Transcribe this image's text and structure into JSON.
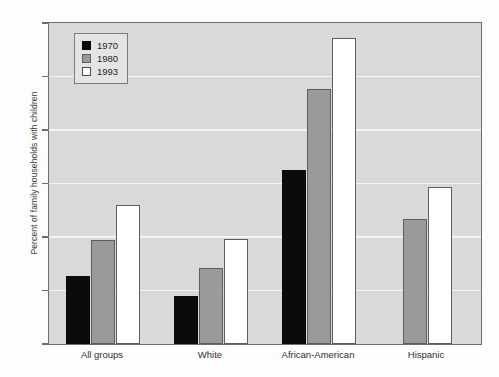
{
  "chart_data": {
    "type": "bar",
    "title": "",
    "subtitle": "",
    "xlabel": "",
    "ylabel": "Percent of family households with children",
    "ylim": [
      0,
      60
    ],
    "yticks": [
      0,
      10,
      20,
      30,
      40,
      50,
      60
    ],
    "ytick_labels": [
      "0",
      "10",
      "20",
      "30",
      "40",
      "50",
      "60"
    ],
    "grid": true,
    "grid_axis": "y",
    "legend_position": "upper-left-inside",
    "categories": [
      "All groups",
      "White",
      "African-American",
      "Hispanic"
    ],
    "series": [
      {
        "name": "1970",
        "color": "#0b0b0b",
        "values": [
          12.7,
          8.9,
          32.6,
          null
        ]
      },
      {
        "name": "1980",
        "color": "#9a9a9a",
        "values": [
          19.5,
          14.3,
          47.6,
          23.3
        ]
      },
      {
        "name": "1993",
        "color": "#ffffff",
        "values": [
          25.9,
          19.7,
          57.2,
          29.3
        ]
      }
    ],
    "plot_background": "#d9d9d9",
    "gridline_color": "#f4f4f4",
    "axis_color": "#6e6e6e",
    "annotations": []
  },
  "legend": {
    "entries": [
      {
        "label": "1970",
        "swatch": "black-square"
      },
      {
        "label": "1980",
        "swatch": "gray-square"
      },
      {
        "label": "1993",
        "swatch": "white-square"
      }
    ]
  }
}
